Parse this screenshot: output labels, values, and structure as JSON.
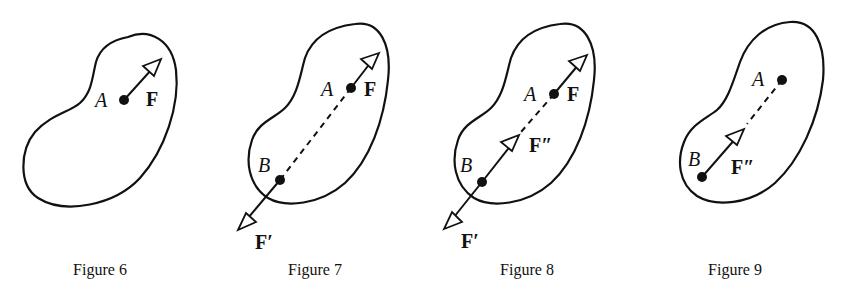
{
  "figures": [
    {
      "caption": "Figure 6",
      "labels": {
        "A": "A",
        "F": "F"
      }
    },
    {
      "caption": "Figure 7",
      "labels": {
        "A": "A",
        "F": "F",
        "B": "B",
        "F_prime": "F′"
      }
    },
    {
      "caption": "Figure 8",
      "labels": {
        "A": "A",
        "F": "F",
        "B": "B",
        "F_double_prime": "F″",
        "F_prime": "F′"
      }
    },
    {
      "caption": "Figure 9",
      "labels": {
        "A": "A",
        "B": "B",
        "F_double_prime": "F″"
      }
    }
  ],
  "colors": {
    "ink": "#111111",
    "background": "#ffffff"
  }
}
